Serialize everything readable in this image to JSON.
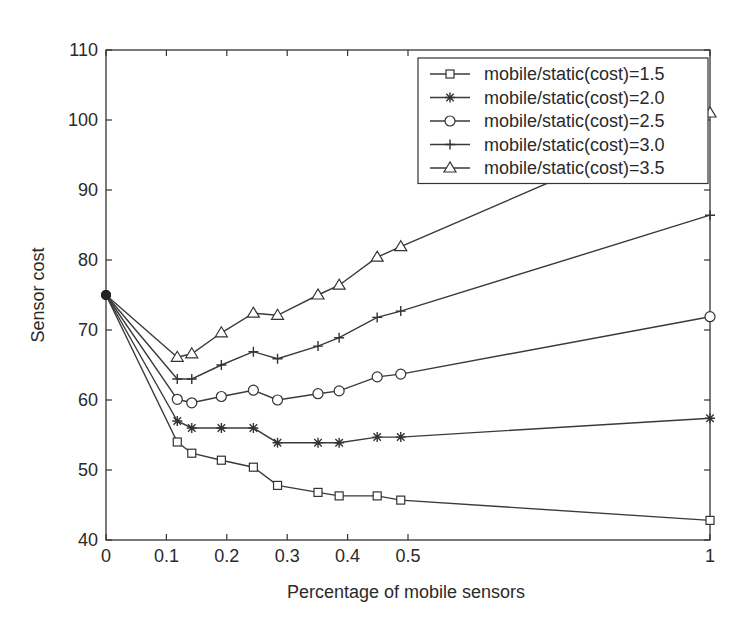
{
  "chart_data": {
    "type": "line",
    "title": "",
    "xlabel": "Percentage of mobile sensors",
    "ylabel": "Sensor cost",
    "xlim": [
      0,
      1
    ],
    "ylim": [
      40,
      110
    ],
    "xticks": [
      0,
      0.1,
      0.2,
      0.3,
      0.4,
      0.5,
      1
    ],
    "xtick_labels": [
      "0",
      "0.1",
      "0.2",
      "0.3",
      "0.4",
      "0.5",
      "1"
    ],
    "yticks": [
      40,
      50,
      60,
      70,
      80,
      90,
      100,
      110
    ],
    "ytick_labels": [
      "40",
      "50",
      "60",
      "70",
      "80",
      "90",
      "100",
      "110"
    ],
    "grid": false,
    "legend_position": "top-right",
    "x": [
      0,
      0.118,
      0.142,
      0.191,
      0.244,
      0.284,
      0.351,
      0.386,
      0.449,
      0.488,
      1.0
    ],
    "series": [
      {
        "name": "mobile/static(cost)=1.5",
        "marker": "square",
        "values": [
          75,
          54.0,
          52.4,
          51.4,
          50.4,
          47.8,
          46.8,
          46.3,
          46.3,
          45.7,
          42.8
        ]
      },
      {
        "name": "mobile/static(cost)=2.0",
        "marker": "star",
        "values": [
          75,
          57.0,
          56.0,
          56.0,
          56.0,
          53.9,
          53.9,
          53.9,
          54.7,
          54.7,
          57.4
        ]
      },
      {
        "name": "mobile/static(cost)=2.5",
        "marker": "circle",
        "values": [
          75,
          60.1,
          59.6,
          60.5,
          61.4,
          60.0,
          60.9,
          61.3,
          63.3,
          63.7,
          71.9
        ]
      },
      {
        "name": "mobile/static(cost)=3.0",
        "marker": "plus",
        "values": [
          75,
          63.0,
          63.0,
          65.0,
          66.9,
          65.9,
          67.7,
          68.9,
          71.8,
          72.7,
          86.4
        ]
      },
      {
        "name": "mobile/static(cost)=3.5",
        "marker": "triangle",
        "values": [
          75,
          66.1,
          66.6,
          69.6,
          72.4,
          72.1,
          75.0,
          76.4,
          80.4,
          81.9,
          101.0
        ]
      }
    ]
  }
}
